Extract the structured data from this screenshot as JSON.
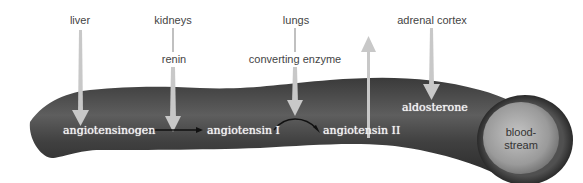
{
  "diagram": {
    "colors": {
      "vessel_dark": "#2e2e2e",
      "vessel_mid": "#5a5a5a",
      "arrow_fill": "#c8c8c8",
      "inner_text": "#f2f2f2",
      "outer_text": "#444444",
      "lumen": "#a9a9a9"
    },
    "organs": [
      {
        "id": "liver",
        "label": "liver"
      },
      {
        "id": "kidneys",
        "label": "kidneys"
      },
      {
        "id": "lungs",
        "label": "lungs"
      },
      {
        "id": "adrenal-cortex",
        "label": "adrenal cortex"
      }
    ],
    "enzymes": [
      {
        "id": "renin",
        "label": "renin"
      },
      {
        "id": "converting-enzyme",
        "label": "converting enzyme"
      }
    ],
    "molecules": [
      {
        "id": "angiotensinogen",
        "label": "angiotensinogen"
      },
      {
        "id": "angiotensin-1",
        "label": "angiotensin I"
      },
      {
        "id": "angiotensin-2",
        "label": "angiotensin II"
      },
      {
        "id": "aldosterone",
        "label": "aldosterone"
      }
    ],
    "vessel_label": "blood-\nstream",
    "vessel_label_line1": "blood-",
    "vessel_label_line2": "stream"
  }
}
